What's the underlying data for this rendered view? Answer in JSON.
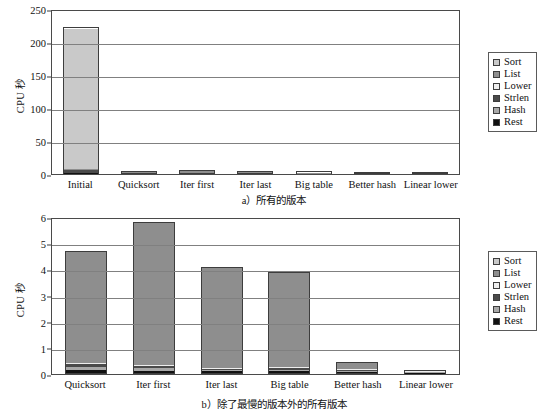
{
  "figure": {
    "ylabel": "CPU 秒",
    "captions": {
      "a": "a）所有的版本",
      "b": "b）除了最慢的版本外的所有版本"
    }
  },
  "legend": {
    "position": "right",
    "items": [
      {
        "label": "Sort",
        "color": "#c9c9c9"
      },
      {
        "label": "List",
        "color": "#8e8e8e"
      },
      {
        "label": "Lower",
        "color": "#eeeeee"
      },
      {
        "label": "Strlen",
        "color": "#4a4a4a"
      },
      {
        "label": "Hash",
        "color": "#a8a8a8"
      },
      {
        "label": "Rest",
        "color": "#111111"
      }
    ]
  },
  "chart_data": [
    {
      "id": "a",
      "type": "bar",
      "stacked": true,
      "title": "a）所有的版本",
      "xlabel": "",
      "ylabel": "CPU 秒",
      "ylim": [
        0,
        250
      ],
      "yticks": [
        0,
        50,
        100,
        150,
        200,
        250
      ],
      "grid": true,
      "categories": [
        "Initial",
        "Quicksort",
        "Iter first",
        "Iter last",
        "Big table",
        "Better hash",
        "Linear lower"
      ],
      "series": [
        {
          "name": "Rest",
          "color": "#111111",
          "values": [
            0.2,
            0.1,
            0.1,
            0.1,
            0.1,
            0.05,
            0.05
          ]
        },
        {
          "name": "Hash",
          "color": "#a8a8a8",
          "values": [
            0.5,
            0.2,
            0.2,
            0.2,
            0.2,
            0.1,
            0.05
          ]
        },
        {
          "name": "Strlen",
          "color": "#4a4a4a",
          "values": [
            4.0,
            0.2,
            0.2,
            0.1,
            0.1,
            0.05,
            0.02
          ]
        },
        {
          "name": "Lower",
          "color": "#eeeeee",
          "values": [
            0.3,
            0.1,
            0.1,
            0.1,
            0.1,
            0.05,
            0.02
          ]
        },
        {
          "name": "List",
          "color": "#8e8e8e",
          "values": [
            1.0,
            4.1,
            5.2,
            3.6,
            3.4,
            0.2,
            0.06
          ]
        },
        {
          "name": "Sort",
          "color": "#c9c9c9",
          "values": [
            216.0,
            0.0,
            0.0,
            0.0,
            0.0,
            0.0,
            0.0
          ]
        }
      ],
      "totals": [
        222.0,
        4.7,
        5.8,
        4.1,
        3.9,
        0.45,
        0.2
      ]
    },
    {
      "id": "b",
      "type": "bar",
      "stacked": true,
      "title": "b）除了最慢的版本外的所有版本",
      "xlabel": "",
      "ylabel": "CPU 秒",
      "ylim": [
        0,
        6
      ],
      "yticks": [
        0,
        1,
        2,
        3,
        4,
        5,
        6
      ],
      "grid": true,
      "categories": [
        "Quicksort",
        "Iter first",
        "Iter last",
        "Big table",
        "Better hash",
        "Linear lower"
      ],
      "series": [
        {
          "name": "Rest",
          "color": "#111111",
          "values": [
            0.1,
            0.08,
            0.06,
            0.06,
            0.04,
            0.03
          ]
        },
        {
          "name": "Hash",
          "color": "#a8a8a8",
          "values": [
            0.12,
            0.1,
            0.04,
            0.06,
            0.05,
            0.03
          ]
        },
        {
          "name": "Strlen",
          "color": "#4a4a4a",
          "values": [
            0.12,
            0.1,
            0.06,
            0.08,
            0.03,
            0.03
          ]
        },
        {
          "name": "Lower",
          "color": "#eeeeee",
          "values": [
            0.06,
            0.02,
            0.02,
            0.02,
            0.05,
            0.02
          ]
        },
        {
          "name": "List",
          "color": "#8e8e8e",
          "values": [
            4.3,
            5.5,
            3.92,
            3.68,
            0.28,
            0.06
          ]
        },
        {
          "name": "Sort",
          "color": "#c9c9c9",
          "values": [
            0.0,
            0.0,
            0.0,
            0.0,
            0.0,
            0.0
          ]
        }
      ],
      "totals": [
        4.7,
        5.8,
        4.1,
        3.9,
        0.45,
        0.17
      ]
    }
  ]
}
